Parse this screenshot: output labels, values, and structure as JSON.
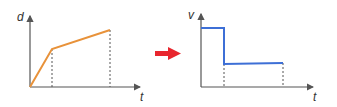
{
  "diagram": {
    "left_graph": {
      "y_label": "d",
      "x_label": "t",
      "line_color": "#e8923a",
      "description": "distance-time: steep rise then shallower rise"
    },
    "arrow": {
      "color": "#e8262e",
      "icon": "right-arrow-icon"
    },
    "right_graph": {
      "y_label": "v",
      "x_label": "t",
      "line_color": "#3d6fd6",
      "description": "velocity-time: high constant then lower constant"
    },
    "axis_color": "#555555"
  }
}
